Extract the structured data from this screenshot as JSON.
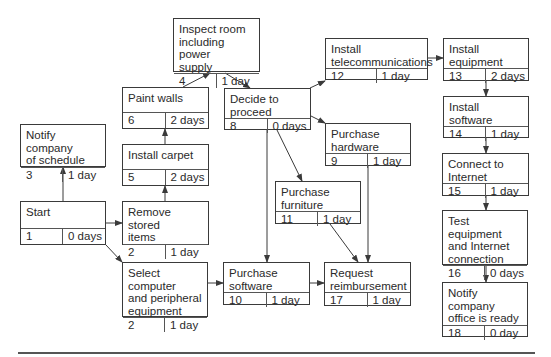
{
  "diagram": {
    "type": "project-network-diagram",
    "nodes": [
      {
        "key": "inspect",
        "title": "Inspect room\nincluding power\nsupply",
        "id": "4",
        "duration": "1 day",
        "box": [
          173,
          18,
          87,
          54
        ]
      },
      {
        "key": "paint",
        "title": "Paint walls",
        "id": "6",
        "duration": "2 days",
        "box": [
          122,
          87,
          87,
          42
        ]
      },
      {
        "key": "decide",
        "title": "Decide to\nproceed",
        "id": "8",
        "duration": "0 days",
        "box": [
          224,
          88,
          87,
          42
        ]
      },
      {
        "key": "telecom",
        "title": "Install\ntelecommunications",
        "id": "12",
        "duration": "1 day",
        "box": [
          325,
          38,
          103,
          42
        ]
      },
      {
        "key": "equipment",
        "title": "Install\nequipment",
        "id": "13",
        "duration": "2 days",
        "box": [
          443,
          38,
          86,
          43
        ]
      },
      {
        "key": "notify",
        "title": "Notify company\nof schedule",
        "id": "3",
        "duration": "1 day",
        "box": [
          20,
          124,
          86,
          43
        ]
      },
      {
        "key": "carpet",
        "title": "Install carpet",
        "id": "5",
        "duration": "2 days",
        "box": [
          122,
          144,
          87,
          42
        ]
      },
      {
        "key": "hardware",
        "title": "Purchase\nhardware",
        "id": "9",
        "duration": "1 day",
        "box": [
          325,
          123,
          86,
          43
        ]
      },
      {
        "key": "software_inst",
        "title": "Install\nsoftware",
        "id": "14",
        "duration": "1 day",
        "box": [
          443,
          96,
          86,
          42
        ]
      },
      {
        "key": "start",
        "title": "Start",
        "id": "1",
        "duration": "0 days",
        "box": [
          20,
          201,
          86,
          44
        ]
      },
      {
        "key": "remove",
        "title": "Remove stored\nitems",
        "id": "2",
        "duration": "1 day",
        "box": [
          122,
          201,
          87,
          44
        ]
      },
      {
        "key": "internet",
        "title": "Connect to\nInternet",
        "id": "15",
        "duration": "1 day",
        "box": [
          442,
          153,
          87,
          43
        ]
      },
      {
        "key": "furniture",
        "title": "Purchase\nfurniture",
        "id": "11",
        "duration": "1 day",
        "box": [
          275,
          181,
          86,
          43
        ]
      },
      {
        "key": "test",
        "title": "Test equipment\nand Internet\nconnection",
        "id": "16",
        "duration": "0 days",
        "box": [
          442,
          210,
          86,
          55
        ]
      },
      {
        "key": "select",
        "title": "Select computer\nand peripheral\nequipment",
        "id": "2",
        "duration": "1 day",
        "box": [
          122,
          262,
          86,
          55
        ]
      },
      {
        "key": "software_buy",
        "title": "Purchase\nsoftware",
        "id": "10",
        "duration": "1 day",
        "box": [
          223,
          262,
          87,
          43
        ]
      },
      {
        "key": "reimburse",
        "title": "Request\nreimbursement",
        "id": "17",
        "duration": "1 day",
        "box": [
          324,
          262,
          87,
          44
        ]
      },
      {
        "key": "ready",
        "title": "Notify company\noffice is ready",
        "id": "18",
        "duration": "0 day",
        "box": [
          442,
          282,
          86,
          55
        ]
      }
    ],
    "edges": [
      {
        "from": "start",
        "to": "notify",
        "points": [
          [
            63,
            201
          ],
          [
            63,
            167
          ]
        ]
      },
      {
        "from": "start",
        "to": "remove",
        "points": [
          [
            106,
            223
          ],
          [
            122,
            223
          ]
        ]
      },
      {
        "from": "start",
        "to": "select",
        "points": [
          [
            106,
            245
          ],
          [
            122,
            262
          ]
        ]
      },
      {
        "from": "remove",
        "to": "carpet",
        "points": [
          [
            165,
            201
          ],
          [
            165,
            186
          ]
        ]
      },
      {
        "from": "carpet",
        "to": "paint",
        "points": [
          [
            165,
            144
          ],
          [
            165,
            129
          ]
        ]
      },
      {
        "from": "paint",
        "to": "inspect",
        "points": [
          [
            183,
            87
          ],
          [
            210,
            73
          ]
        ]
      },
      {
        "from": "inspect",
        "to": "decide",
        "points": [
          [
            225,
            73
          ],
          [
            250,
            88
          ]
        ]
      },
      {
        "from": "decide",
        "to": "telecom",
        "points": [
          [
            310,
            88
          ],
          [
            325,
            81
          ]
        ]
      },
      {
        "from": "decide",
        "to": "hardware",
        "points": [
          [
            311,
            116
          ],
          [
            325,
            123
          ]
        ]
      },
      {
        "from": "decide",
        "to": "furniture",
        "points": [
          [
            277,
            130
          ],
          [
            302,
            181
          ]
        ]
      },
      {
        "from": "decide",
        "to": "software_buy",
        "points": [
          [
            267,
            130
          ],
          [
            267,
            262
          ]
        ]
      },
      {
        "from": "telecom",
        "to": "equipment",
        "points": [
          [
            428,
            58
          ],
          [
            443,
            58
          ]
        ]
      },
      {
        "from": "equipment",
        "to": "software_inst",
        "points": [
          [
            486,
            81
          ],
          [
            486,
            96
          ]
        ]
      },
      {
        "from": "software_inst",
        "to": "internet",
        "points": [
          [
            486,
            138
          ],
          [
            486,
            153
          ]
        ]
      },
      {
        "from": "internet",
        "to": "test",
        "points": [
          [
            486,
            196
          ],
          [
            486,
            210
          ]
        ]
      },
      {
        "from": "test",
        "to": "ready",
        "points": [
          [
            486,
            265
          ],
          [
            486,
            282
          ]
        ]
      },
      {
        "from": "select",
        "to": "software_buy",
        "points": [
          [
            208,
            283
          ],
          [
            223,
            283
          ]
        ]
      },
      {
        "from": "software_buy",
        "to": "reimburse",
        "points": [
          [
            310,
            283
          ],
          [
            324,
            283
          ]
        ]
      },
      {
        "from": "furniture",
        "to": "reimburse",
        "points": [
          [
            330,
            224
          ],
          [
            358,
            262
          ]
        ]
      },
      {
        "from": "hardware",
        "to": "reimburse",
        "points": [
          [
            368,
            166
          ],
          [
            368,
            262
          ]
        ]
      }
    ],
    "colors": {
      "line": "#3a3a3a",
      "text": "#2a2a2a",
      "background": "#ffffff"
    }
  }
}
